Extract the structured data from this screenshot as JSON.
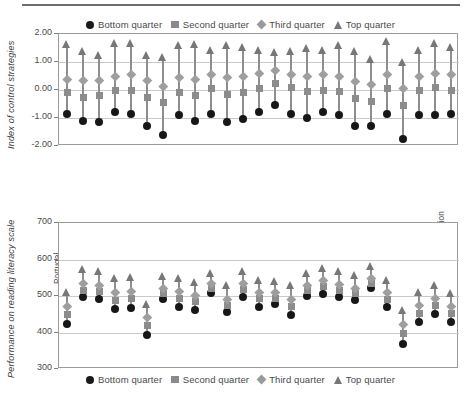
{
  "divider": "top-rule",
  "legend": {
    "entries": [
      {
        "label": "Bottom quarter",
        "marker": "circle-marker",
        "color": "#171717"
      },
      {
        "label": "Second quarter",
        "marker": "square-marker",
        "color": "#8c8c8c"
      },
      {
        "label": "Third quarter",
        "marker": "diamond-marker",
        "color": "#9e9e9e"
      },
      {
        "label": "Top quarter",
        "marker": "triangle-marker",
        "color": "#777777"
      }
    ]
  },
  "categories": [
    "Portugal",
    "New Zealand",
    "Australia",
    "Czech Republic",
    "Germany",
    "United States",
    "Mexico",
    "Ireland",
    "Switzerland",
    "Korea",
    "Luxembourg",
    "Sweden",
    "Austria",
    "Italy",
    "Hungary",
    "Iceland",
    "Finland",
    "Belgium (Fl.)",
    "Denmark",
    "Netherlands*",
    "Norway",
    "Brazil",
    "Latvia",
    "Liechtenstein",
    "Russian Federation"
  ],
  "chart_data": [
    {
      "id": "index-of-control-strategies",
      "type": "scatter",
      "title": "",
      "xlabel": "",
      "ylabel": "Index of control strategies",
      "ylim": [
        -2.0,
        2.0
      ],
      "yticks": [
        2.0,
        1.0,
        0.0,
        -1.0,
        -2.0
      ],
      "ytick_labels": [
        "2.00",
        "1.00",
        "0.00",
        "-1.00",
        "-2.00"
      ],
      "grid": true,
      "legend_position": "above",
      "categories": [
        "Portugal",
        "New Zealand",
        "Australia",
        "Czech Republic",
        "Germany",
        "United States",
        "Mexico",
        "Ireland",
        "Switzerland",
        "Korea",
        "Luxembourg",
        "Sweden",
        "Austria",
        "Italy",
        "Hungary",
        "Iceland",
        "Finland",
        "Belgium (Fl.)",
        "Denmark",
        "Netherlands*",
        "Norway",
        "Brazil",
        "Latvia",
        "Liechtenstein",
        "Russian Federation"
      ],
      "series": [
        {
          "name": "Bottom quarter",
          "marker": "circle",
          "values": [
            -0.85,
            -1.1,
            -1.15,
            -0.8,
            -0.85,
            -1.3,
            -1.6,
            -0.9,
            -1.1,
            -0.85,
            -1.15,
            -1.05,
            -0.8,
            -0.55,
            -0.85,
            -1.0,
            -0.8,
            -0.9,
            -1.3,
            -1.3,
            -0.85,
            -1.75,
            -0.9,
            -0.9,
            -0.85
          ]
        },
        {
          "name": "Second quarter",
          "marker": "square",
          "values": [
            -0.1,
            -0.25,
            -0.2,
            0.0,
            0.0,
            -0.25,
            -0.45,
            -0.1,
            -0.2,
            0.05,
            -0.15,
            -0.1,
            0.05,
            0.25,
            0.1,
            -0.05,
            0.0,
            -0.05,
            -0.3,
            -0.4,
            0.05,
            -0.55,
            0.0,
            0.1,
            0.0
          ]
        },
        {
          "name": "Third quarter",
          "marker": "diamond",
          "values": [
            0.4,
            0.35,
            0.35,
            0.5,
            0.55,
            0.35,
            0.15,
            0.45,
            0.4,
            0.55,
            0.45,
            0.5,
            0.6,
            0.7,
            0.55,
            0.5,
            0.55,
            0.5,
            0.3,
            0.2,
            0.55,
            0.05,
            0.5,
            0.6,
            0.55
          ]
        },
        {
          "name": "Top quarter",
          "marker": "triangle",
          "values": [
            1.5,
            1.25,
            1.1,
            1.55,
            1.55,
            1.1,
            1.05,
            1.45,
            1.5,
            1.3,
            1.45,
            1.4,
            1.3,
            1.2,
            1.25,
            1.35,
            1.3,
            1.45,
            1.25,
            0.95,
            1.6,
            0.85,
            1.3,
            1.55,
            1.4
          ]
        }
      ]
    },
    {
      "id": "performance-on-reading-literacy-scale",
      "type": "scatter",
      "title": "",
      "xlabel": "",
      "ylabel": "Performance on reading literacy scale",
      "ylim": [
        300,
        700
      ],
      "yticks": [
        700,
        600,
        500,
        400,
        300
      ],
      "ytick_labels": [
        "700",
        "600",
        "500",
        "400",
        "300"
      ],
      "grid": true,
      "legend_position": "below",
      "categories": [
        "Portugal",
        "New Zealand",
        "Australia",
        "Czech Republic",
        "Germany",
        "United States",
        "Mexico",
        "Ireland",
        "Switzerland",
        "Korea",
        "Luxembourg",
        "Sweden",
        "Austria",
        "Italy",
        "Hungary",
        "Iceland",
        "Finland",
        "Belgium (Fl.)",
        "Denmark",
        "Netherlands*",
        "Norway",
        "Brazil",
        "Latvia",
        "Liechtenstein",
        "Russian Federation"
      ],
      "series": [
        {
          "name": "Bottom quarter",
          "marker": "circle",
          "values": [
            422,
            496,
            493,
            464,
            466,
            392,
            493,
            470,
            463,
            508,
            455,
            497,
            470,
            478,
            447,
            500,
            505,
            497,
            489,
            521,
            470,
            368,
            429,
            452,
            428
          ]
        },
        {
          "name": "Second quarter",
          "marker": "square",
          "values": [
            450,
            515,
            512,
            489,
            492,
            420,
            508,
            493,
            484,
            521,
            474,
            518,
            492,
            494,
            472,
            515,
            525,
            516,
            506,
            535,
            491,
            398,
            453,
            474,
            452
          ]
        },
        {
          "name": "Third quarter",
          "marker": "diamond",
          "values": [
            472,
            535,
            530,
            510,
            513,
            442,
            522,
            512,
            503,
            535,
            492,
            535,
            510,
            509,
            492,
            530,
            543,
            533,
            522,
            549,
            509,
            422,
            474,
            494,
            472
          ]
        },
        {
          "name": "Top quarter",
          "marker": "triangle",
          "values": [
            500,
            562,
            557,
            537,
            542,
            468,
            545,
            538,
            528,
            553,
            518,
            558,
            534,
            530,
            518,
            552,
            566,
            558,
            546,
            570,
            534,
            450,
            500,
            520,
            498
          ]
        }
      ]
    }
  ]
}
